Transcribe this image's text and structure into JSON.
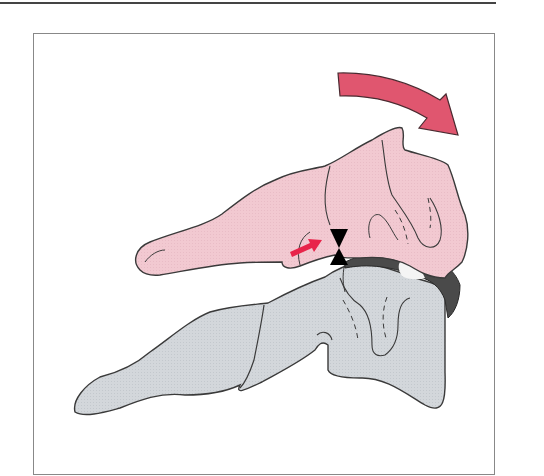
{
  "figure": {
    "colors": {
      "upper_bone_fill": "#f2c9d1",
      "lower_bone_fill": "#d3d7db",
      "outline": "#3a3a3a",
      "rotation_arrow": "#e0566f",
      "small_arrow": "#e8244a",
      "pivot_marker": "#000000",
      "joint_dark": "#4a4a4a",
      "joint_highlight": "#f4f4f4",
      "frame_border": "#888888",
      "top_rule": "#444444"
    },
    "elements": [
      {
        "name": "upper-vertebra",
        "color": "pink"
      },
      {
        "name": "lower-vertebra",
        "color": "gray"
      },
      {
        "name": "rotation-arrow",
        "direction": "clockwise"
      },
      {
        "name": "force-arrow",
        "direction": "right"
      },
      {
        "name": "pivot-marker",
        "shape": "bowtie"
      }
    ]
  }
}
